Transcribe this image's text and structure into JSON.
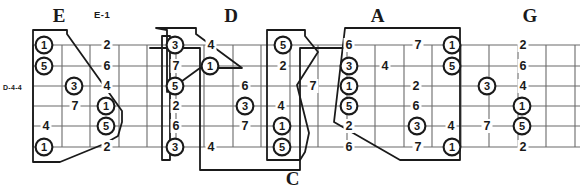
{
  "diagram": {
    "kind": "guitar-fretboard-caged-diagram",
    "left_label": "D-4-4",
    "top_label": "E-1",
    "ink_color": "#1a1a1a",
    "grid_color": "#6b6b6b"
  },
  "shape_labels": [
    {
      "name": "E",
      "text": "E",
      "x": 118,
      "y": 22
    },
    {
      "name": "D",
      "text": "D",
      "x": 462,
      "y": 22
    },
    {
      "name": "A",
      "text": "A",
      "x": 755,
      "y": 22
    },
    {
      "name": "G",
      "text": "G",
      "x": 1060,
      "y": 22
    },
    {
      "name": "C",
      "text": "C",
      "x": 585,
      "y": 182
    }
  ],
  "strings": {
    "count": 6,
    "y": [
      45,
      66,
      86,
      106,
      126,
      147
    ]
  },
  "frets": {
    "x": [
      33,
      62,
      90,
      119,
      147,
      176,
      204,
      233,
      261,
      290,
      318,
      347,
      375,
      404,
      432,
      461,
      489,
      518,
      546,
      575
    ]
  },
  "notes": [
    {
      "degree": "1",
      "circled": true,
      "x": 44,
      "y": 45
    },
    {
      "degree": "5",
      "circled": true,
      "x": 44,
      "y": 66
    },
    {
      "degree": "3",
      "circled": true,
      "x": 74,
      "y": 86
    },
    {
      "degree": "7",
      "circled": false,
      "x": 75,
      "y": 106
    },
    {
      "degree": "4",
      "circled": false,
      "x": 46,
      "y": 126
    },
    {
      "degree": "1",
      "circled": true,
      "x": 44,
      "y": 147
    },
    {
      "degree": "2",
      "circled": false,
      "x": 107,
      "y": 45
    },
    {
      "degree": "6",
      "circled": false,
      "x": 107,
      "y": 66
    },
    {
      "degree": "4",
      "circled": false,
      "x": 107,
      "y": 86
    },
    {
      "degree": "1",
      "circled": true,
      "x": 106,
      "y": 106
    },
    {
      "degree": "5",
      "circled": true,
      "x": 106,
      "y": 126
    },
    {
      "degree": "2",
      "circled": false,
      "x": 107,
      "y": 147
    },
    {
      "degree": "3",
      "circled": true,
      "x": 175,
      "y": 45
    },
    {
      "degree": "7",
      "circled": false,
      "x": 176,
      "y": 66
    },
    {
      "degree": "5",
      "circled": true,
      "x": 175,
      "y": 86
    },
    {
      "degree": "2",
      "circled": false,
      "x": 176,
      "y": 106
    },
    {
      "degree": "6",
      "circled": false,
      "x": 176,
      "y": 126
    },
    {
      "degree": "3",
      "circled": true,
      "x": 175,
      "y": 147
    },
    {
      "degree": "4",
      "circled": false,
      "x": 211,
      "y": 45
    },
    {
      "degree": "1",
      "circled": true,
      "x": 210,
      "y": 66
    },
    {
      "degree": "6",
      "circled": false,
      "x": 245,
      "y": 86
    },
    {
      "degree": "3",
      "circled": true,
      "x": 245,
      "y": 106
    },
    {
      "degree": "7",
      "circled": false,
      "x": 245,
      "y": 126
    },
    {
      "degree": "4",
      "circled": false,
      "x": 211,
      "y": 147
    },
    {
      "degree": "5",
      "circled": true,
      "x": 283,
      "y": 45
    },
    {
      "degree": "2",
      "circled": false,
      "x": 283,
      "y": 66
    },
    {
      "degree": "7",
      "circled": false,
      "x": 313,
      "y": 86
    },
    {
      "degree": "4",
      "circled": false,
      "x": 281,
      "y": 106
    },
    {
      "degree": "1",
      "circled": true,
      "x": 282,
      "y": 126
    },
    {
      "degree": "5",
      "circled": true,
      "x": 282,
      "y": 147
    },
    {
      "degree": "6",
      "circled": false,
      "x": 349,
      "y": 45
    },
    {
      "degree": "3",
      "circled": true,
      "x": 349,
      "y": 66
    },
    {
      "degree": "1",
      "circled": true,
      "x": 349,
      "y": 86
    },
    {
      "degree": "5",
      "circled": true,
      "x": 349,
      "y": 106
    },
    {
      "degree": "2",
      "circled": false,
      "x": 349,
      "y": 126
    },
    {
      "degree": "6",
      "circled": false,
      "x": 349,
      "y": 147
    },
    {
      "degree": "4",
      "circled": false,
      "x": 385,
      "y": 66
    },
    {
      "degree": "2",
      "circled": false,
      "x": 416,
      "y": 86
    },
    {
      "degree": "6",
      "circled": false,
      "x": 416,
      "y": 106
    },
    {
      "degree": "3",
      "circled": true,
      "x": 417,
      "y": 126
    },
    {
      "degree": "7",
      "circled": false,
      "x": 418,
      "y": 45
    },
    {
      "degree": "7",
      "circled": false,
      "x": 418,
      "y": 147
    },
    {
      "degree": "4",
      "circled": false,
      "x": 451,
      "y": 126
    },
    {
      "degree": "1",
      "circled": true,
      "x": 452,
      "y": 45
    },
    {
      "degree": "5",
      "circled": true,
      "x": 452,
      "y": 66
    },
    {
      "degree": "1",
      "circled": true,
      "x": 452,
      "y": 147
    },
    {
      "degree": "3",
      "circled": true,
      "x": 487,
      "y": 86
    },
    {
      "degree": "7",
      "circled": false,
      "x": 487,
      "y": 126
    },
    {
      "degree": "2",
      "circled": false,
      "x": 523,
      "y": 45
    },
    {
      "degree": "6",
      "circled": false,
      "x": 523,
      "y": 66
    },
    {
      "degree": "4",
      "circled": false,
      "x": 523,
      "y": 86
    },
    {
      "degree": "1",
      "circled": true,
      "x": 522,
      "y": 106
    },
    {
      "degree": "5",
      "circled": true,
      "x": 522,
      "y": 126
    },
    {
      "degree": "2",
      "circled": false,
      "x": 523,
      "y": 147
    }
  ],
  "shape_outlines": [
    {
      "name": "E",
      "d": "M 33 30 L 67 30 L 67 34 L 122 111 L 122 122 L 118 136 L 104 144 L 60 162 L 33 162 Z"
    },
    {
      "name": "D",
      "d": "M 156 28 L 196 28 L 196 34 L 242 68 L 200 68 L 167 92 L 167 30 Z"
    },
    {
      "name": "D-outer",
      "d": "M 162 36 L 170 36 L 170 160 L 162 160 Z"
    },
    {
      "name": "A",
      "d": "M 267 30 L 305 30 L 305 36 L 318 52 L 297 85 L 309 133 L 305 152 L 300 160 L 267 160 Z"
    },
    {
      "name": "G",
      "d": "M 345 28 L 460 28 L 460 160 L 400 160 L 334 122 Z"
    },
    {
      "name": "C",
      "d": "M 150 48 L 200 48 L 200 170 L 300 170 L 300 48 L 345 48"
    }
  ]
}
